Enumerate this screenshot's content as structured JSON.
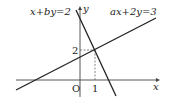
{
  "diagram": {
    "axes": {
      "x_label": "x",
      "y_label": "y",
      "origin_label": "O"
    },
    "ticks": {
      "x_tick": "1",
      "y_tick": "2"
    },
    "lines": [
      {
        "equation": "x+by=2",
        "description": "steep decreasing line through (1,2)"
      },
      {
        "equation": "ax+2y=3",
        "description": "increasing line through (1,2)"
      }
    ],
    "intersection": {
      "x": 1,
      "y": 2
    }
  }
}
